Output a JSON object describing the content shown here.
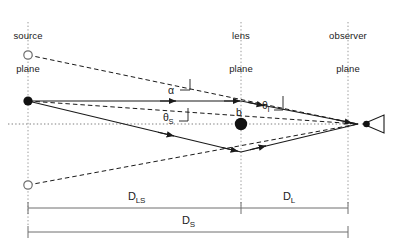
{
  "figure": {
    "type": "diagram",
    "width": 396,
    "height": 248,
    "background_color": "#ffffff",
    "ink_color": "#1a1a1a",
    "guide_color": "#9a9a9a"
  },
  "planes": [
    {
      "id": "source",
      "label_line1": "source",
      "label_line2": "plane",
      "x": 28,
      "label_x": 28,
      "label_y": 8,
      "line_top": 22,
      "line_bottom": 226
    },
    {
      "id": "lens",
      "label_line1": "lens",
      "label_line2": "plane",
      "x": 241,
      "label_x": 241,
      "label_y": 8,
      "line_top": 22,
      "line_bottom": 206
    },
    {
      "id": "observer",
      "label_line1": "observer",
      "label_line2": "plane",
      "x": 348,
      "label_x": 348,
      "label_y": 8,
      "line_top": 22,
      "line_bottom": 206
    }
  ],
  "optical_axis": {
    "y": 124,
    "x_start": 8,
    "x_end": 360,
    "style": "dotted"
  },
  "markers": {
    "image_upper": {
      "type": "open-circle",
      "x": 28,
      "y": 55,
      "r": 4.2,
      "name": "upper-image-position"
    },
    "source_true": {
      "type": "filled-circle",
      "x": 28,
      "y": 101,
      "r": 4.6,
      "name": "true-source-position"
    },
    "image_lower": {
      "type": "open-circle",
      "x": 28,
      "y": 185,
      "r": 4.2,
      "name": "lower-image-position"
    },
    "lens_mass": {
      "type": "filled-circle",
      "x": 241,
      "y": 124,
      "r": 6.2,
      "name": "lens-mass"
    },
    "observer_eye": {
      "type": "eye",
      "x": 372,
      "y": 124,
      "name": "observer-eye"
    }
  },
  "rays": {
    "upper_deflected": {
      "from_x": 28,
      "from_y": 101,
      "bend_x": 241,
      "bend_y": 101,
      "to_x": 360,
      "to_y": 124
    },
    "lower_deflected": {
      "from_x": 28,
      "from_y": 101,
      "bend_x": 241,
      "bend_y": 152,
      "to_x": 360,
      "to_y": 124
    },
    "upper_apparent": {
      "from_x": 28,
      "from_y": 55,
      "to_x": 360,
      "to_y": 124
    },
    "lower_apparent": {
      "from_x": 28,
      "from_y": 185,
      "to_x": 360,
      "to_y": 124
    },
    "axis_to_observer": {
      "from_x": 28,
      "from_y": 101,
      "to_x": 360,
      "to_y": 124
    }
  },
  "angle_labels": [
    {
      "id": "alpha",
      "text": "α",
      "sub": "",
      "x": 168,
      "y": 84,
      "name": "deflection-angle-alpha"
    },
    {
      "id": "theta_s",
      "text": "θ",
      "sub": "S",
      "x": 163,
      "y": 111,
      "name": "source-angle-theta-s"
    },
    {
      "id": "theta_i",
      "text": "θ",
      "sub": "I",
      "x": 262,
      "y": 99,
      "name": "image-angle-theta-i"
    }
  ],
  "impact_parameter": {
    "text": "b",
    "x": 236,
    "y": 110,
    "name": "impact-parameter-b"
  },
  "distances": [
    {
      "id": "D_LS",
      "text": "D",
      "sub": "LS",
      "label_x": 128,
      "label_y": 192,
      "bar_y": 208,
      "bar_x1": 28,
      "bar_x2": 241,
      "name": "distance-lens-source"
    },
    {
      "id": "D_L",
      "text": "D",
      "sub": "L",
      "label_x": 283,
      "label_y": 192,
      "bar_y": 208,
      "bar_x1": 241,
      "bar_x2": 348,
      "name": "distance-observer-lens"
    },
    {
      "id": "D_S",
      "text": "D",
      "sub": "S",
      "label_x": 182,
      "label_y": 216,
      "bar_y": 232,
      "bar_x1": 28,
      "bar_x2": 348,
      "name": "distance-observer-source"
    }
  ]
}
